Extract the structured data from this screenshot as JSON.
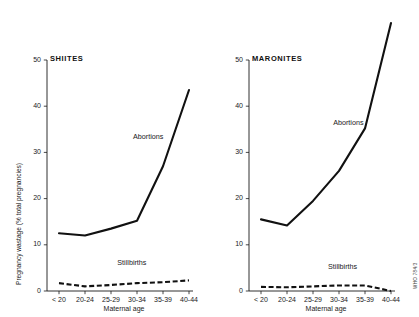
{
  "figure": {
    "background_color": "#ffffff",
    "line_color": "#111111",
    "credit": "WHO 784/3"
  },
  "chart_data": [
    {
      "type": "line",
      "title": "SHIITES",
      "xlabel": "Maternal age",
      "ylabel": "Pregnancy wastage (% total pregnancies)",
      "categories": [
        "< 20",
        "20-24",
        "25-29",
        "30-34",
        "35-39",
        "40-44"
      ],
      "ylim": [
        0,
        50
      ],
      "yticks": [
        0,
        10,
        20,
        30,
        40,
        50
      ],
      "grid": false,
      "legend_position": "inline-annotation",
      "series": [
        {
          "name": "Abortions",
          "style": "solid",
          "values": [
            12.5,
            12.0,
            13.5,
            15.2,
            27.0,
            43.5
          ]
        },
        {
          "name": "Stillbirths",
          "style": "dashed",
          "values": [
            1.7,
            1.0,
            1.3,
            1.7,
            1.9,
            2.3
          ]
        }
      ]
    },
    {
      "type": "line",
      "title": "MARONITES",
      "xlabel": "Maternal age",
      "ylabel": "",
      "categories": [
        "< 20",
        "20-24",
        "25-29",
        "30-34",
        "35-39",
        "40-44"
      ],
      "ylim": [
        0,
        50
      ],
      "yticks": [
        0,
        10,
        20,
        30,
        40,
        50
      ],
      "grid": false,
      "legend_position": "inline-annotation",
      "series": [
        {
          "name": "Abortions",
          "style": "solid",
          "values": [
            15.5,
            14.2,
            19.5,
            26.0,
            35.2,
            58.0
          ]
        },
        {
          "name": "Stillbirths",
          "style": "dashed",
          "values": [
            0.9,
            0.8,
            1.0,
            1.2,
            1.2,
            0.0
          ]
        }
      ]
    }
  ]
}
